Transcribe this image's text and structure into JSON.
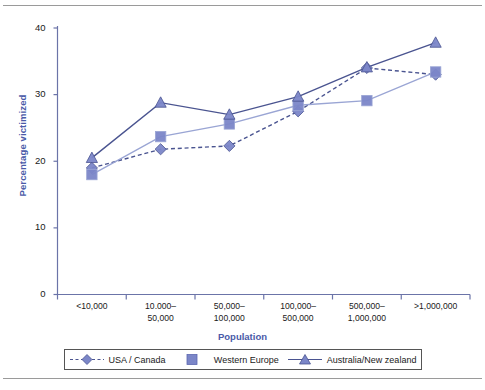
{
  "chart_data": {
    "type": "line",
    "title": "",
    "xlabel": "Population",
    "ylabel": "Percentage victimized",
    "categories": [
      "<10,000",
      "10.000–\n50,000",
      "50,000–\n100,000",
      "100,000–\n500,000",
      "500,000–\n1,000,000",
      ">1,000,000"
    ],
    "category_lines": [
      [
        "<10,000",
        ""
      ],
      [
        "10.000–",
        "50,000"
      ],
      [
        "50,000–",
        "100,000"
      ],
      [
        "100,000–",
        "500,000"
      ],
      [
        "500,000–",
        "1,000,000"
      ],
      [
        ">1,000,000",
        ""
      ]
    ],
    "ylim": [
      0,
      40
    ],
    "yticks": [
      0,
      10,
      20,
      30,
      40
    ],
    "ytick_labels": [
      "0",
      "10",
      "20",
      "30",
      "40"
    ],
    "grid": false,
    "legend_position": "bottom",
    "series": [
      {
        "name": "USA / Canada",
        "marker": "diamond",
        "line_style": "dashed",
        "color": "#4a5490",
        "marker_color": "#7b86c8",
        "values": [
          19.0,
          21.8,
          22.3,
          27.5,
          34.0,
          33.0
        ]
      },
      {
        "name": "Western Europe",
        "marker": "square",
        "line_style": "solid",
        "color": "#9aa5d4",
        "marker_color": "#7b86c8",
        "values": [
          18.0,
          23.7,
          25.6,
          28.4,
          29.1,
          33.4
        ]
      },
      {
        "name": "Australia/New zealand",
        "marker": "triangle",
        "line_style": "solid",
        "color": "#4a5490",
        "marker_color": "#7b86c8",
        "values": [
          20.5,
          28.8,
          27.0,
          29.7,
          34.1,
          37.8
        ]
      }
    ]
  },
  "colors": {
    "axis_label": "#4a5aa8",
    "axis_line": "#6b74a8",
    "tick_text": "#1a1a1a",
    "rule": "#9a9a9a"
  },
  "legend": {
    "items": [
      {
        "label": "USA / Canada",
        "icon": "diamond-marker-dashed-line-icon"
      },
      {
        "label": "Western Europe",
        "icon": "square-marker-icon"
      },
      {
        "label": "Australia/New zealand",
        "icon": "triangle-marker-solid-line-icon"
      }
    ]
  }
}
